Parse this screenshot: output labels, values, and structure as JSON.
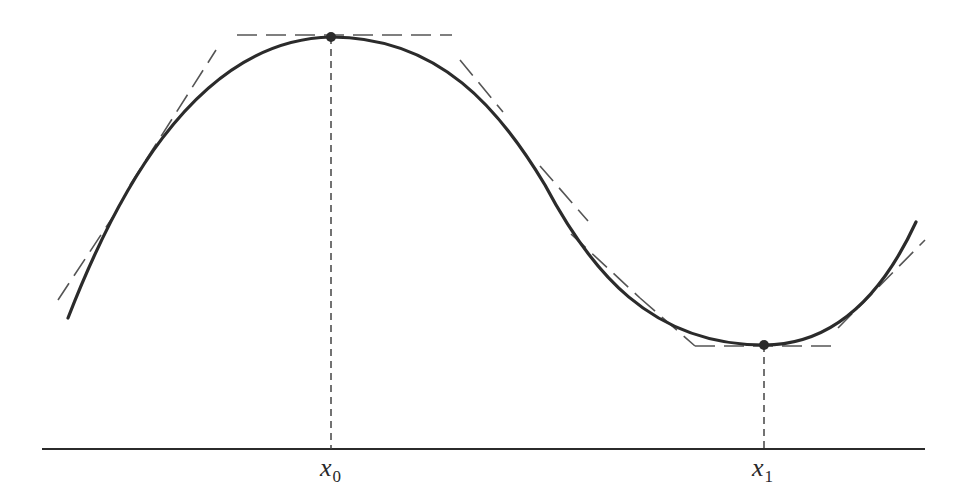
{
  "figure": {
    "colors": {
      "curve": "#2b2b2b",
      "tangent": "#555555",
      "axis": "#2b2b2b",
      "dropline": "#444444",
      "point": "#2b2b2b"
    },
    "axis": {
      "y": 449,
      "x_start": 42,
      "x_end": 925
    },
    "curve_path": "M 68 318 C 110 210, 190 40, 331 37 C 440 37, 500 110, 545 185 C 590 270, 650 345, 764 345 C 830 345, 880 300, 916 222",
    "extrema": [
      {
        "name": "local-maximum",
        "x": 331,
        "y": 37
      },
      {
        "name": "local-minimum",
        "x": 764,
        "y": 345
      }
    ],
    "tangents": [
      {
        "x1": 58,
        "y1": 300,
        "x2": 122,
        "y2": 203
      },
      {
        "x1": 130,
        "y1": 185,
        "x2": 216,
        "y2": 50
      },
      {
        "x1": 237,
        "y1": 35,
        "x2": 452,
        "y2": 35
      },
      {
        "x1": 460,
        "y1": 60,
        "x2": 503,
        "y2": 112
      },
      {
        "x1": 540,
        "y1": 166,
        "x2": 588,
        "y2": 221
      },
      {
        "x1": 571,
        "y1": 234,
        "x2": 640,
        "y2": 298
      },
      {
        "x1": 640,
        "y1": 298,
        "x2": 695,
        "y2": 346
      },
      {
        "x1": 695,
        "y1": 346,
        "x2": 838,
        "y2": 346
      },
      {
        "x1": 838,
        "y1": 328,
        "x2": 925,
        "y2": 240
      }
    ],
    "droplines": [
      {
        "x": 331,
        "y_top": 37,
        "y_bottom": 449
      },
      {
        "x": 764,
        "y_top": 345,
        "y_bottom": 449
      }
    ],
    "labels": [
      {
        "id": "x0",
        "base": "x",
        "sub": "0",
        "left": 320,
        "top": 455
      },
      {
        "id": "x1",
        "base": "x",
        "sub": "1",
        "left": 752,
        "top": 455
      }
    ]
  }
}
